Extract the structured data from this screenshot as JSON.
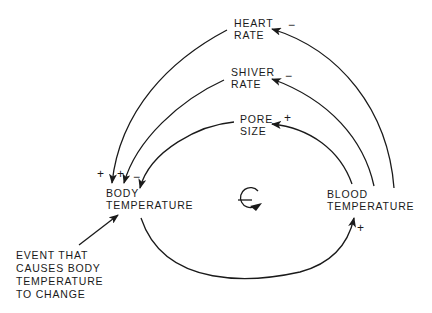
{
  "diagram": {
    "type": "causal-loop",
    "loop_polarity": "−",
    "nodes": {
      "heart_rate": {
        "line1": "HEART",
        "line2": "RATE"
      },
      "shiver_rate": {
        "line1": "SHIVER",
        "line2": "RATE"
      },
      "pore_size": {
        "line1": "PORE",
        "line2": "SIZE"
      },
      "body_temperature": {
        "line1": "BODY",
        "line2": "TEMPERATURE"
      },
      "blood_temperature": {
        "line1": "BLOOD",
        "line2": "TEMPERATURE"
      },
      "event": {
        "line1": "EVENT THAT",
        "line2": "CAUSES BODY",
        "line3": "TEMPERATURE",
        "line4": "TO CHANGE"
      }
    },
    "links": [
      {
        "from": "BLOOD TEMPERATURE",
        "to": "HEART RATE",
        "sign": "−"
      },
      {
        "from": "BLOOD TEMPERATURE",
        "to": "SHIVER RATE",
        "sign": "−"
      },
      {
        "from": "BLOOD TEMPERATURE",
        "to": "PORE SIZE",
        "sign": "+"
      },
      {
        "from": "HEART RATE",
        "to": "BODY TEMPERATURE",
        "sign": "+"
      },
      {
        "from": "SHIVER RATE",
        "to": "BODY TEMPERATURE",
        "sign": "+"
      },
      {
        "from": "PORE SIZE",
        "to": "BODY TEMPERATURE",
        "sign": "−"
      },
      {
        "from": "BODY TEMPERATURE",
        "to": "BLOOD TEMPERATURE",
        "sign": "+"
      },
      {
        "from": "EVENT THAT CAUSES BODY TEMPERATURE TO CHANGE",
        "to": "BODY TEMPERATURE",
        "sign": ""
      }
    ],
    "signs": {
      "heart_rate_in": "−",
      "shiver_rate_in": "−",
      "pore_size_in": "+",
      "body_from_heart": "+",
      "body_from_shiver": "+",
      "body_from_pore": "−",
      "blood_from_body": "+"
    }
  }
}
